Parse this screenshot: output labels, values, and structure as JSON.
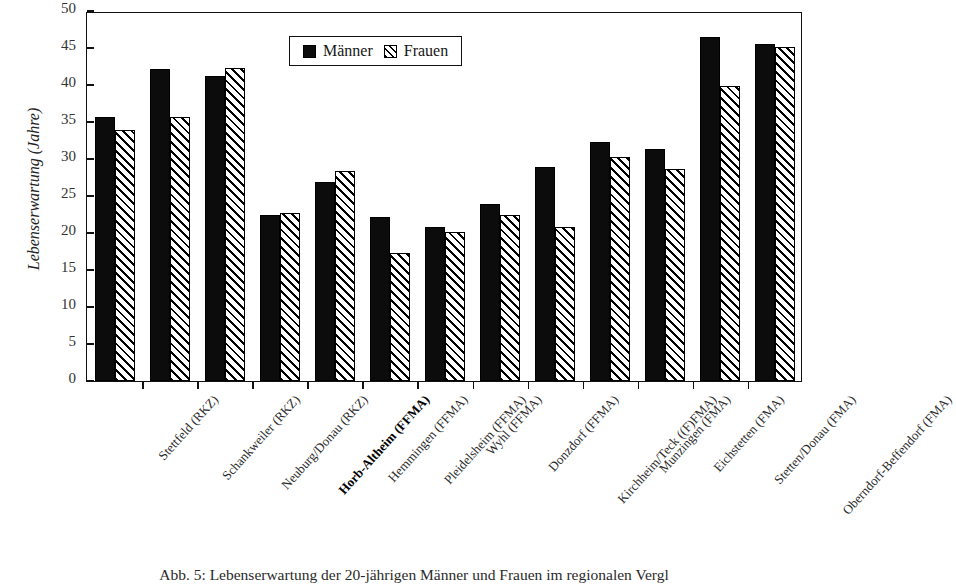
{
  "chart_data": {
    "type": "bar",
    "title": "",
    "xlabel": "",
    "ylabel": "Lebenserwartung (Jahre)",
    "ylim": [
      0,
      50
    ],
    "yticks": [
      0,
      5,
      10,
      15,
      20,
      25,
      30,
      35,
      40,
      45,
      50
    ],
    "grid": false,
    "legend_position": "top-center",
    "categories": [
      "Stettfeld (RKZ)",
      "Schankweiler (RKZ)",
      "Neuburg/Donau (RKZ)",
      "Horb-Altheim (FFMA)",
      "Hemmingen (FFMA)",
      "Pleidelsheim (FFMA)",
      "Wyhl (FFMA)",
      "Donzdorf (FFMA)",
      "Kirchheim/Teck ((F)FMA)",
      "Munzingen (FMA)",
      "Eichstetten (FMA)",
      "Stetten/Donau (FMA)",
      "Oberndorf-Beffendorf (FMA)"
    ],
    "emphasized_category": "Horb-Altheim (FFMA)",
    "series": [
      {
        "name": "Männer",
        "values": [
          35.7,
          42.1,
          41.2,
          22.5,
          26.9,
          22.1,
          20.8,
          23.9,
          28.9,
          32.3,
          31.3,
          46.5,
          45.5
        ]
      },
      {
        "name": "Frauen",
        "values": [
          33.9,
          35.7,
          42.3,
          22.7,
          28.4,
          17.3,
          20.2,
          22.5,
          20.8,
          30.3,
          28.7,
          39.9,
          45.2
        ]
      }
    ]
  },
  "legend": {
    "items": [
      {
        "label": "Männer",
        "style": "solid-black"
      },
      {
        "label": "Frauen",
        "style": "hatched"
      }
    ]
  },
  "caption": {
    "text": "Abb. 5:  Lebenserwartung der 20-jährigen Männer und Frauen im regionalen Vergl"
  }
}
